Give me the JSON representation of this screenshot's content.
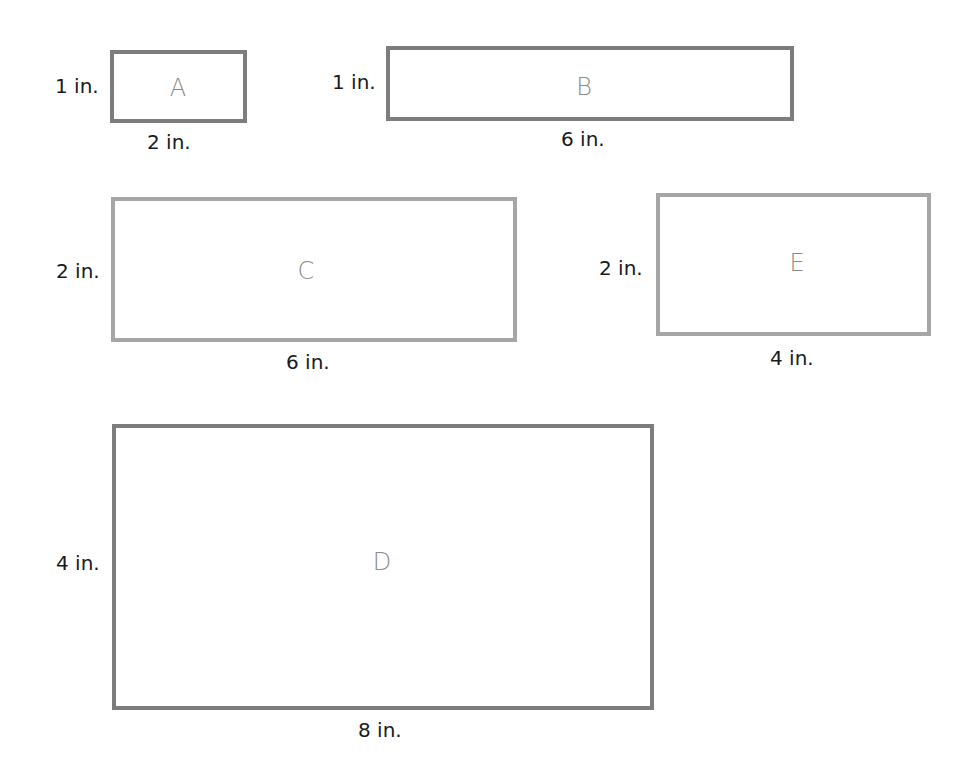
{
  "shapes": [
    {
      "id": "A",
      "label": "A",
      "height_label": "1 in.",
      "width_label": "2 in.",
      "height_in": 1,
      "width_in": 2
    },
    {
      "id": "B",
      "label": "B",
      "height_label": "1 in.",
      "width_label": "6 in.",
      "height_in": 1,
      "width_in": 6
    },
    {
      "id": "C",
      "label": "C",
      "height_label": "2 in.",
      "width_label": "6 in.",
      "height_in": 2,
      "width_in": 6
    },
    {
      "id": "E",
      "label": "E",
      "height_label": "2 in.",
      "width_label": "4 in.",
      "height_in": 2,
      "width_in": 4
    },
    {
      "id": "D",
      "label": "D",
      "height_label": "4 in.",
      "width_label": "8 in.",
      "height_in": 4,
      "width_in": 8
    }
  ],
  "colors": {
    "dark_border": "#7d7d7d",
    "light_border": "#a6a6a6",
    "letter": "#8a8a8a",
    "text": "#1a1a1a"
  }
}
